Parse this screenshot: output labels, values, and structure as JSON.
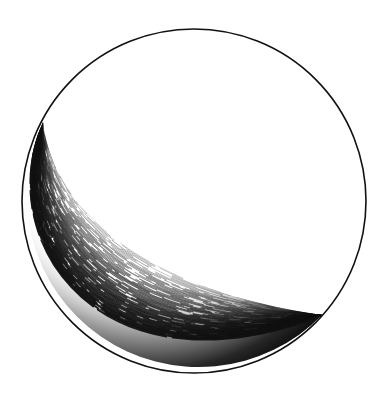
{
  "figure": {
    "subject": "pen-and-ink drawing of a sphere with crescent shading",
    "background_color": "#ffffff",
    "ink_color": "#111111",
    "circle": {
      "cx": 194,
      "cy": 201,
      "r": 172
    },
    "crescent": {
      "tip_upper_left": [
        43,
        122
      ],
      "tip_lower_right": [
        322,
        315
      ],
      "inner_edge_control_1": [
        55,
        215
      ],
      "inner_edge_control_2": [
        150,
        290
      ]
    },
    "shading": "dense curved hatching, darkest along lower-left limb"
  }
}
